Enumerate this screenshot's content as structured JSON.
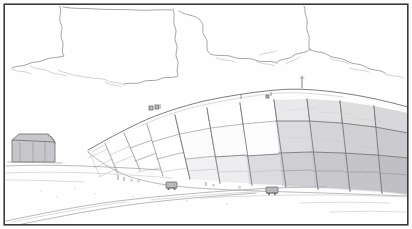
{
  "document": {
    "kind": "scanned-line-drawing",
    "title": "Terraced capped mound with grid of cover panels",
    "medium": "pencil and ink line drawing, grayscale scan",
    "orientation": "landscape",
    "frame": {
      "present": true,
      "style": "thin single rule border",
      "color": "#3a3a3a"
    }
  },
  "palette": {
    "paper": "#fefefe",
    "frame_stroke": "#3a3a3a",
    "outline_stroke": "#6f6f73",
    "grid_stroke": "#9a9a9e",
    "faint_stroke": "#c2c2c6",
    "panel_light": "#ffffff",
    "panel_mid": "#e6e6e8",
    "panel_gray": "#d3d3d6",
    "panel_dark": "#c3c3c7",
    "roof_gray": "#bcbcc0",
    "cloud_stroke": "#8e8e92"
  },
  "scene": {
    "subject": "large terraced earthen mound faced with a grid of rectangular cover panels",
    "viewpoint": "low ground-level view from the front-left",
    "regions": [
      {
        "name": "sky",
        "label": "Sky with outlined cumulus clouds",
        "fill": "#ffffff",
        "description": "upper half of the sheet, blank white paper with soft wavy cloud contours"
      },
      {
        "name": "mound",
        "label": "Terraced mound with panel grid",
        "description": "dominant mass sweeping from mid-left up to the right edge, divided into quadrilateral panels by perspective grid lines"
      },
      {
        "name": "building",
        "label": "Small shed with gabled gray roof",
        "description": "low structure at the left edge in front of the mound toe"
      },
      {
        "name": "foreground",
        "label": "Flat ground with access road",
        "description": "lower strip of the sheet, faint ground lines and a curving haul road"
      }
    ],
    "annotations": [
      {
        "name": "summit-mast",
        "label": "Slender mast at the crest",
        "x": 302,
        "y": 88
      },
      {
        "name": "crest-figures",
        "label": "Small figures on the upper ridge",
        "x": 152,
        "y": 108
      },
      {
        "name": "toe-vehicle-left",
        "label": "Vehicle at the mound toe",
        "x": 171,
        "y": 185
      },
      {
        "name": "toe-vehicle-right",
        "label": "Vehicle at the mound toe",
        "x": 272,
        "y": 190
      },
      {
        "name": "haul-road",
        "label": "Curving haul road in the foreground",
        "x": 150,
        "y": 208
      }
    ]
  },
  "clouds": [
    {
      "name": "cloud-left-upper",
      "label": "Upper left cloud bank"
    },
    {
      "name": "cloud-center",
      "label": "Central cloud with lobed base"
    },
    {
      "name": "cloud-right",
      "label": "Right cloud drifting to the frame"
    },
    {
      "name": "cloud-low-right",
      "label": "Low haze band above the crest"
    }
  ],
  "panel_grid": {
    "label": "Cover panel grid on the mound face",
    "columns": 9,
    "rows": 5,
    "shading_note": "panels grow progressively darker toward the right and lower rows",
    "tones": [
      "#ffffff",
      "#f4f4f5",
      "#ececee",
      "#e2e2e5",
      "#d8d8db",
      "#cfcfd3",
      "#c7c7cb"
    ]
  }
}
